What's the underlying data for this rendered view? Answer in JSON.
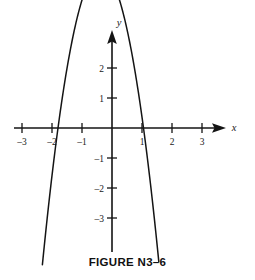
{
  "figure": {
    "caption": "FIGURE N3–6",
    "top_clipped_text": "",
    "background_color": "#ffffff",
    "ink_color": "#141414"
  },
  "chart_data": {
    "type": "line",
    "title": "FIGURE N3–6",
    "xlabel": "x",
    "ylabel": "y",
    "grid": false,
    "legend": "none",
    "xlim": [
      -3.3,
      3.6
    ],
    "ylim": [
      -4.0,
      3.3
    ],
    "xticks": [
      -3,
      -2,
      -1,
      1,
      2,
      3
    ],
    "xtick_labels": [
      "–3",
      "–2",
      "–1",
      "1",
      "2",
      "3"
    ],
    "yticks": [
      2,
      1,
      -1,
      -2,
      -3
    ],
    "ytick_labels": [
      "2",
      "1",
      "–1",
      "–2",
      "–3"
    ],
    "series": [
      {
        "name": "parabola",
        "shape": "downward-opening parabola",
        "vertex": [
          -0.4,
          2.45
        ],
        "roots": [
          -1.8,
          1.05
        ],
        "leading_coefficient": -2.6,
        "equation": "y = -2.6(x + 1.8)(x - 1.05)",
        "x": [
          -2.55,
          -2.4,
          -2.2,
          -2.0,
          -1.8,
          -1.6,
          -1.4,
          -1.2,
          -1.0,
          -0.8,
          -0.6,
          -0.4,
          -0.2,
          0.0,
          0.2,
          0.4,
          0.6,
          0.8,
          1.0,
          1.2,
          1.4,
          1.6,
          1.8,
          1.95
        ],
        "y": [
          -5.08,
          -3.94,
          -2.5,
          -1.17,
          0.0,
          1.04,
          1.96,
          2.75,
          3.43,
          3.97,
          4.4,
          4.69,
          4.87,
          4.91,
          4.84,
          4.64,
          4.32,
          3.88,
          3.31,
          2.63,
          1.82,
          0.89,
          -0.16,
          -1.05
        ]
      }
    ],
    "annotations": []
  },
  "axes": {
    "x_axis_label": "x",
    "y_axis_label": "y",
    "x_axis_arrow": "right-arrow-icon",
    "y_axis_arrow": "up-arrow-icon"
  }
}
